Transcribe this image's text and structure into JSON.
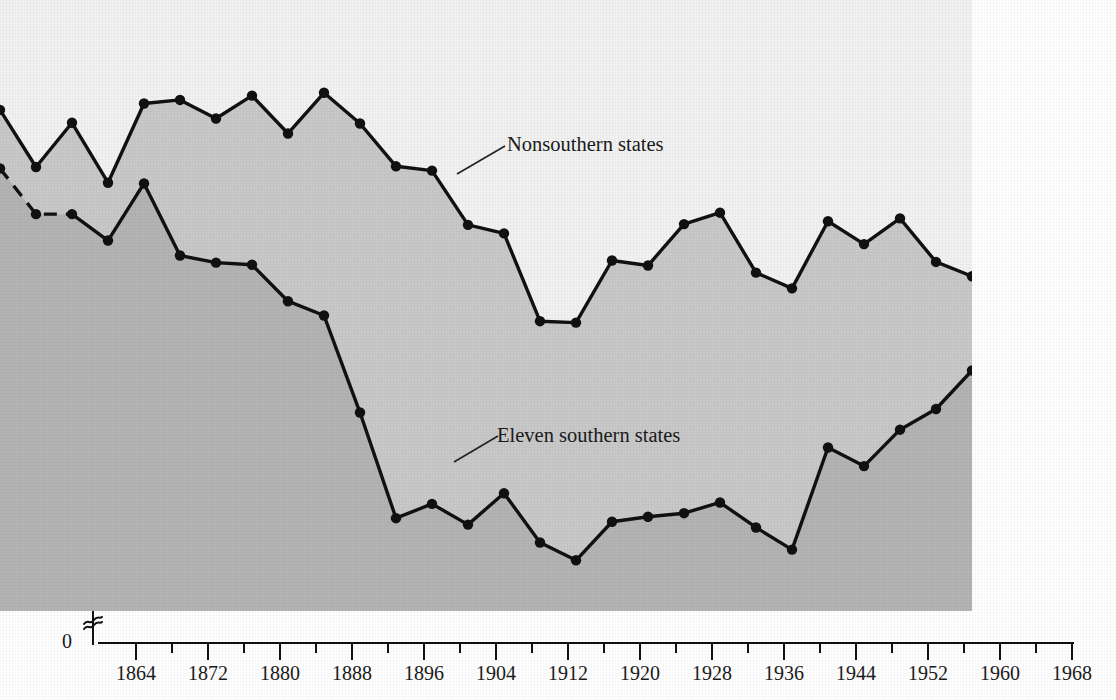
{
  "chart_data": {
    "type": "line",
    "title": "",
    "xlabel": "",
    "ylabel": "Percentage of estimated eligible electorate actually voting",
    "xlim": [
      1860,
      1968
    ],
    "ylim": [
      0,
      100
    ],
    "y_major_ticks": [
      0,
      20,
      30,
      40,
      50,
      60,
      70,
      80,
      90,
      100
    ],
    "y_tick_labels": [
      "0",
      "20",
      "30",
      "40",
      "50",
      "60",
      "70",
      "80",
      "90",
      "100"
    ],
    "y_minor_ticks": [
      25,
      35,
      45,
      55,
      65,
      75,
      85,
      95
    ],
    "y_axis_break": true,
    "y_axis_break_between": [
      0,
      20
    ],
    "x_major_ticks": [
      1864,
      1872,
      1880,
      1888,
      1896,
      1904,
      1912,
      1920,
      1928,
      1936,
      1944,
      1952,
      1960,
      1968
    ],
    "x_tick_labels": [
      "1864",
      "1872",
      "1880",
      "1888",
      "1896",
      "1904",
      "1912",
      "1920",
      "1928",
      "1936",
      "1944",
      "1952",
      "1960",
      "1968"
    ],
    "x_minor_ticks": [
      1868,
      1876,
      1884,
      1892,
      1900,
      1908,
      1916,
      1924,
      1932,
      1940,
      1948,
      1956,
      1964
    ],
    "grid": false,
    "legend_position": "inline-annotation",
    "x": [
      1860,
      1864,
      1868,
      1872,
      1876,
      1880,
      1884,
      1888,
      1892,
      1896,
      1900,
      1904,
      1908,
      1912,
      1916,
      1920,
      1924,
      1928,
      1932,
      1936,
      1940,
      1944,
      1948,
      1952,
      1956,
      1960,
      1964,
      1968
    ],
    "series": [
      {
        "name": "Nonsouthern states",
        "label": "Nonsouthern states",
        "color": "#111111",
        "fill_color": "#c9c9c9",
        "values": [
          84.6,
          76.6,
          82.8,
          74.4,
          85.5,
          86.0,
          83.4,
          86.6,
          81.3,
          87.0,
          82.7,
          76.7,
          76.1,
          68.5,
          67.3,
          55.0,
          54.8,
          63.5,
          62.8,
          68.6,
          70.2,
          61.8,
          59.6,
          69.0,
          65.8,
          69.4,
          63.3,
          61.3
        ]
      },
      {
        "name": "Eleven southern states",
        "label": "Eleven southern states",
        "color": "#111111",
        "fill_color": "#b4b4b4",
        "dashed_segment_years": [
          1860,
          1868
        ],
        "values": [
          76.4,
          70.0,
          70.0,
          66.3,
          74.3,
          64.2,
          63.2,
          62.9,
          57.8,
          55.8,
          42.2,
          27.4,
          29.4,
          26.5,
          30.9,
          24.0,
          21.5,
          26.9,
          27.6,
          28.1,
          29.6,
          26.1,
          23.0,
          37.3,
          34.7,
          39.8,
          42.7,
          48.1
        ]
      }
    ],
    "annotations": [
      {
        "text": "Nonsouthern states",
        "anchor_year": 1900
      },
      {
        "text": "Eleven southern states",
        "anchor_year": 1898
      }
    ],
    "background_top_color": "#f2f2f2",
    "background_mid_color": "#c9c9c9",
    "background_low_color": "#b4b4b4"
  }
}
